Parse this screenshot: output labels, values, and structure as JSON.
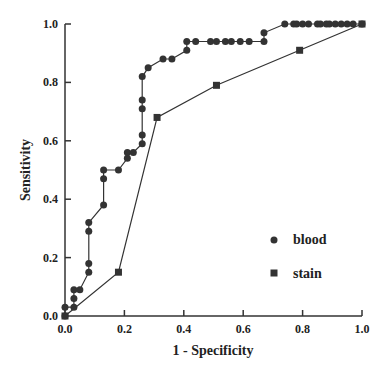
{
  "chart_data": {
    "type": "line",
    "title": "",
    "xlabel": "1 - Specificity",
    "ylabel": "Sensitivity",
    "xlim": [
      0,
      1
    ],
    "ylim": [
      0,
      1
    ],
    "grid": false,
    "legend_position": "lower right (inside)",
    "xticks": [
      "0.0",
      "0.2",
      "0.4",
      "0.6",
      "0.8",
      "1.0"
    ],
    "yticks": [
      "0.0",
      "0.2",
      "0.4",
      "0.6",
      "0.8",
      "1.0"
    ],
    "series": [
      {
        "name": "blood",
        "marker": "circle",
        "color": "#333333",
        "x": [
          0.0,
          0.0,
          0.03,
          0.03,
          0.03,
          0.05,
          0.08,
          0.08,
          0.08,
          0.08,
          0.13,
          0.13,
          0.13,
          0.18,
          0.21,
          0.21,
          0.23,
          0.26,
          0.26,
          0.26,
          0.26,
          0.26,
          0.28,
          0.33,
          0.36,
          0.41,
          0.41,
          0.44,
          0.49,
          0.51,
          0.54,
          0.56,
          0.59,
          0.62,
          0.67,
          0.67,
          0.74,
          0.77,
          0.78,
          0.8,
          0.82,
          0.85,
          0.86,
          0.88,
          0.89,
          0.91,
          0.93,
          0.95,
          0.97,
          1.0
        ],
        "y": [
          0.0,
          0.03,
          0.03,
          0.06,
          0.09,
          0.09,
          0.15,
          0.18,
          0.29,
          0.32,
          0.38,
          0.47,
          0.5,
          0.5,
          0.54,
          0.56,
          0.56,
          0.59,
          0.62,
          0.71,
          0.74,
          0.82,
          0.85,
          0.88,
          0.88,
          0.91,
          0.94,
          0.94,
          0.94,
          0.94,
          0.94,
          0.94,
          0.94,
          0.94,
          0.94,
          0.97,
          1.0,
          1.0,
          1.0,
          1.0,
          1.0,
          1.0,
          1.0,
          1.0,
          1.0,
          1.0,
          1.0,
          1.0,
          1.0,
          1.0
        ]
      },
      {
        "name": "stain",
        "marker": "square",
        "color": "#333333",
        "x": [
          0.0,
          0.18,
          0.31,
          0.51,
          0.79,
          1.0
        ],
        "y": [
          0.0,
          0.15,
          0.68,
          0.79,
          0.91,
          1.0
        ]
      }
    ]
  },
  "legend": {
    "items": [
      {
        "label": "blood",
        "marker": "circle"
      },
      {
        "label": "stain",
        "marker": "square"
      }
    ]
  },
  "axes": {
    "x_title": "1 - Specificity",
    "y_title": "Sensitivity"
  }
}
